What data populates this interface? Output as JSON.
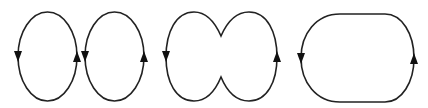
{
  "diagram": {
    "stroke_color": "#222222",
    "arrow_color": "#111111",
    "background": "#ffffff",
    "shapes": [
      {
        "id": "loop-1",
        "kind": "ellipse",
        "left_arrow": "down",
        "right_arrow": "up"
      },
      {
        "id": "loop-2",
        "kind": "ellipse",
        "left_arrow": "down",
        "right_arrow": "up"
      },
      {
        "id": "loop-3",
        "kind": "pinched-double-lobe",
        "left_arrow": "down",
        "right_arrow": "up"
      },
      {
        "id": "loop-4",
        "kind": "rounded-stadium",
        "left_arrow": "down",
        "right_arrow": "up"
      }
    ]
  }
}
